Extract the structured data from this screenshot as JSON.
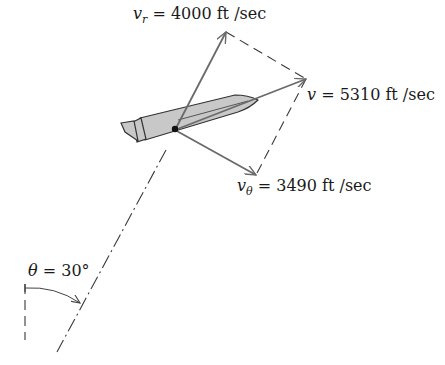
{
  "diagram": {
    "type": "velocity-vector-diagram",
    "colors": {
      "vector": "#6a6a6a",
      "dashed": "#3a3a3a",
      "rocket_fill": "#c8c8c8",
      "rocket_stroke": "#333333",
      "text": "#1a1a1a"
    },
    "labels": {
      "vr": {
        "symbol": "v",
        "subscript": "r",
        "equals": " = ",
        "value": "4000",
        "unit": " ft /sec"
      },
      "v": {
        "symbol": "v",
        "equals": " = ",
        "value": "5310",
        "unit": " ft /sec"
      },
      "vtheta": {
        "symbol": "v",
        "subscript": "θ",
        "equals": " = ",
        "value": "3490",
        "unit": " ft /sec"
      },
      "theta": {
        "symbol": "θ",
        "equals": " = ",
        "value": "30°"
      }
    },
    "vectors": [
      {
        "name": "v_r",
        "magnitude": 4000,
        "unit": "ft/sec"
      },
      {
        "name": "v",
        "magnitude": 5310,
        "unit": "ft/sec"
      },
      {
        "name": "v_theta",
        "magnitude": 3490,
        "unit": "ft/sec"
      }
    ],
    "angle": {
      "name": "theta",
      "value_deg": 30
    }
  }
}
